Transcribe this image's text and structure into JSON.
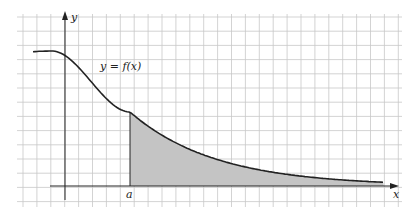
{
  "figure": {
    "curve_label": "y = f(x)",
    "x_axis_label": "x",
    "y_axis_label": "y",
    "point_label": "a",
    "shaded_region": "area under y = f(x) from x = a to the right",
    "colors": {
      "grid": "#c8c8c8",
      "axis": "#222222",
      "curve": "#222222",
      "shade": "#c4c4c4"
    }
  }
}
